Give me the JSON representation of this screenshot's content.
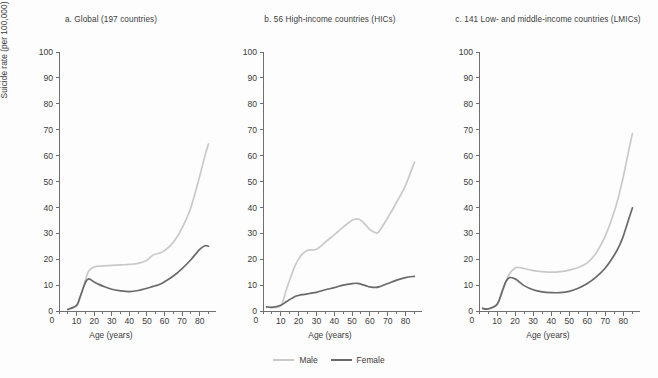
{
  "figure": {
    "background_color": "#fdfdfd",
    "legend": {
      "position": "bottom-center",
      "items": [
        {
          "label": "Male",
          "color": "#c9c9c9"
        },
        {
          "label": "Female",
          "color": "#6a6a6a"
        }
      ]
    }
  },
  "chart_data": [
    {
      "type": "line",
      "id": "panel-a",
      "title": "a. Global (197 countries)",
      "xlabel": "Age (years)",
      "ylabel": "Suicide rate (per 100,000)",
      "xlim": [
        0,
        87
      ],
      "ylim": [
        0,
        100
      ],
      "xticks": [
        0,
        10,
        20,
        30,
        40,
        50,
        60,
        70,
        80
      ],
      "xminor_step": 5,
      "yticks": [
        0,
        10,
        20,
        30,
        40,
        50,
        60,
        70,
        80,
        90,
        100
      ],
      "grid": false,
      "x": [
        5,
        10,
        12,
        15,
        17,
        20,
        22,
        25,
        30,
        35,
        40,
        45,
        50,
        53,
        55,
        57,
        60,
        65,
        70,
        75,
        80,
        83,
        85
      ],
      "series": [
        {
          "name": "Male",
          "color": "#c9c9c9",
          "values": [
            0.6,
            2.0,
            5.0,
            12.0,
            15.5,
            17.0,
            17.3,
            17.4,
            17.6,
            17.8,
            18.0,
            18.4,
            19.6,
            21.4,
            22.0,
            22.3,
            23.3,
            26.5,
            32.0,
            40.0,
            52.0,
            60.0,
            64.5
          ]
        },
        {
          "name": "Female",
          "color": "#6a6a6a",
          "values": [
            0.6,
            2.2,
            5.5,
            11.0,
            12.4,
            11.2,
            10.5,
            9.6,
            8.4,
            7.8,
            7.5,
            7.9,
            8.8,
            9.4,
            9.8,
            10.2,
            11.3,
            13.5,
            16.4,
            19.8,
            23.8,
            25.2,
            25.0
          ]
        }
      ]
    },
    {
      "type": "line",
      "id": "panel-b",
      "title": "b. 56 High-income countries (HICs)",
      "xlabel": "Age (years)",
      "ylabel": "",
      "xlim": [
        0,
        87
      ],
      "ylim": [
        0,
        100
      ],
      "xticks": [
        0,
        10,
        20,
        30,
        40,
        50,
        60,
        70,
        80
      ],
      "xminor_step": 5,
      "yticks": [
        0,
        10,
        20,
        30,
        40,
        50,
        60,
        70,
        80,
        90,
        100
      ],
      "grid": false,
      "x": [
        2,
        5,
        10,
        13,
        15,
        18,
        20,
        22,
        25,
        27,
        30,
        35,
        40,
        45,
        50,
        53,
        55,
        58,
        60,
        63,
        65,
        70,
        75,
        80,
        85
      ],
      "series": [
        {
          "name": "Male",
          "color": "#c9c9c9",
          "values": [
            1.6,
            1.4,
            2.0,
            8.0,
            12.0,
            17.5,
            20.0,
            22.0,
            23.4,
            23.6,
            23.8,
            26.6,
            29.4,
            32.4,
            35.0,
            35.6,
            35.0,
            33.0,
            31.4,
            30.3,
            30.6,
            36.0,
            42.0,
            48.5,
            57.5
          ]
        },
        {
          "name": "Female",
          "color": "#6a6a6a",
          "values": [
            1.6,
            1.4,
            2.2,
            3.6,
            4.4,
            5.6,
            6.0,
            6.3,
            6.6,
            6.9,
            7.2,
            8.2,
            9.0,
            10.0,
            10.6,
            10.7,
            10.4,
            9.7,
            9.3,
            9.1,
            9.3,
            10.6,
            11.9,
            12.9,
            13.4
          ]
        }
      ]
    },
    {
      "type": "line",
      "id": "panel-c",
      "title": "c. 141 Low- and middle-income countries (LMICs)",
      "xlabel": "Age (years)",
      "ylabel": "",
      "xlim": [
        0,
        87
      ],
      "ylim": [
        0,
        100
      ],
      "xticks": [
        0,
        10,
        20,
        30,
        40,
        50,
        60,
        70,
        80
      ],
      "xminor_step": 5,
      "yticks": [
        0,
        10,
        20,
        30,
        40,
        50,
        60,
        70,
        80,
        90,
        100
      ],
      "grid": false,
      "x": [
        2,
        5,
        10,
        13,
        15,
        17,
        20,
        22,
        25,
        30,
        35,
        40,
        45,
        50,
        55,
        60,
        65,
        70,
        75,
        78,
        80,
        83,
        85
      ],
      "series": [
        {
          "name": "Male",
          "color": "#c9c9c9",
          "values": [
            1.0,
            0.8,
            2.4,
            7.5,
            11.5,
            14.5,
            16.6,
            16.8,
            16.4,
            15.6,
            15.2,
            15.0,
            15.2,
            15.8,
            16.8,
            18.6,
            22.5,
            29.0,
            38.5,
            46.0,
            52.0,
            62.0,
            68.5
          ]
        },
        {
          "name": "Female",
          "color": "#6a6a6a",
          "values": [
            1.0,
            0.8,
            2.6,
            8.0,
            11.5,
            12.9,
            12.4,
            11.4,
            9.8,
            8.2,
            7.4,
            7.1,
            7.1,
            7.6,
            8.8,
            10.6,
            13.2,
            16.6,
            21.6,
            25.5,
            29.0,
            35.5,
            39.8
          ]
        }
      ]
    }
  ]
}
